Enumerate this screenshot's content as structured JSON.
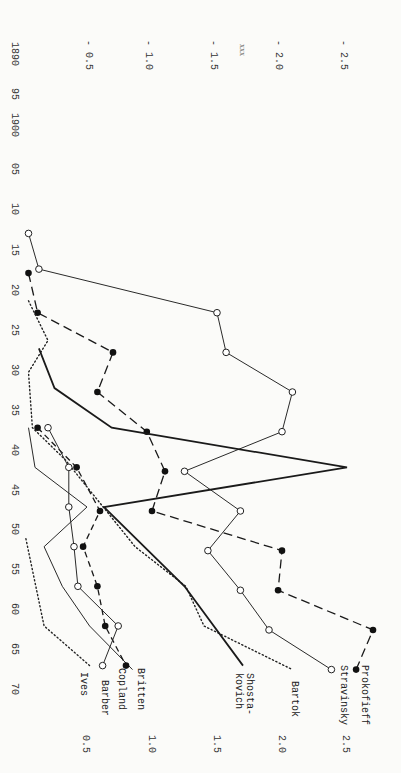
{
  "chart_data": {
    "type": "line",
    "orientation": "rotated 90 degrees clockwise (years run top-to-bottom on left edge, values run left-to-right)",
    "title": "",
    "annotation_top": "xxx",
    "xlabel": "Year",
    "ylabel": "",
    "x_ticks": [
      "1890",
      "95",
      "1900",
      "05",
      "10",
      "15",
      "20",
      "25",
      "30",
      "35",
      "40",
      "45",
      "50",
      "55",
      "60",
      "65",
      "70"
    ],
    "x_range": [
      1890,
      1970
    ],
    "y_ticks_top": [
      "-0.5",
      "-1.0",
      "-1.5",
      "-2.0",
      "-2.5"
    ],
    "y_ticks_bottom": [
      "0.5",
      "1.0",
      "1.5",
      "2.0",
      "2.5"
    ],
    "ylim": [
      0,
      2.75
    ],
    "grid": false,
    "legend": "inline labels at end of each line (bottom)",
    "series": [
      {
        "name": "Prokofieff",
        "style": "long-dash",
        "marker": "filled-circle",
        "x": [
          1917.5,
          1922.5,
          1927.5,
          1932.5,
          1937.5,
          1942.5,
          1947.5,
          1952.5,
          1957.5,
          1962.5,
          1967.5
        ],
        "values": [
          0.05,
          0.12,
          0.7,
          0.58,
          0.96,
          1.1,
          1.0,
          2.0,
          1.97,
          2.7,
          2.57
        ]
      },
      {
        "name": "Stravinsky",
        "style": "thin-solid",
        "marker": "open-circle",
        "x": [
          1912.5,
          1917,
          1922.5,
          1927.5,
          1932.5,
          1937.5,
          1942.5,
          1947.5,
          1952.5,
          1957.5,
          1962.5,
          1967.5
        ],
        "values": [
          0.05,
          0.13,
          1.5,
          1.57,
          2.08,
          2.0,
          1.25,
          1.68,
          1.43,
          1.68,
          1.9,
          2.38
        ]
      },
      {
        "name": "Bartok",
        "style": "dotted",
        "marker": "none",
        "x": [
          1921,
          1926,
          1930,
          1937,
          1941,
          1952,
          1957,
          1962,
          1967.5
        ],
        "values": [
          0.05,
          0.2,
          0.05,
          0.08,
          0.33,
          0.87,
          1.26,
          1.4,
          2.08
        ]
      },
      {
        "name": "Shosta-kovich",
        "style": "thick-solid",
        "marker": "none",
        "x": [
          1927,
          1932,
          1937,
          1942,
          1947,
          1957,
          1967
        ],
        "values": [
          0.13,
          0.25,
          0.69,
          2.5,
          0.63,
          1.25,
          1.7
        ]
      },
      {
        "name": "Britten",
        "style": "thin-solid",
        "marker": "none",
        "x": [
          1937,
          1942,
          1947,
          1952,
          1957,
          1962,
          1967.5
        ],
        "values": [
          0.05,
          0.1,
          0.5,
          0.17,
          0.31,
          0.52,
          0.85
        ]
      },
      {
        "name": "Copland",
        "style": "short-dash",
        "marker": "filled-circle",
        "x": [
          1937,
          1942,
          1947.5,
          1952,
          1957,
          1962,
          1967
        ],
        "values": [
          0.12,
          0.42,
          0.6,
          0.47,
          0.58,
          0.64,
          0.8
        ]
      },
      {
        "name": "Barber",
        "style": "thin-solid",
        "marker": "open-circle",
        "x": [
          1937,
          1942,
          1947,
          1952,
          1957,
          1962,
          1967
        ],
        "values": [
          0.2,
          0.36,
          0.36,
          0.4,
          0.43,
          0.74,
          0.62
        ]
      },
      {
        "name": "Ives",
        "style": "dotted",
        "marker": "none",
        "x": [
          1951,
          1962,
          1967
        ],
        "values": [
          0.03,
          0.17,
          0.52
        ]
      }
    ]
  },
  "labels": {
    "annotation": "xxx",
    "series_labels": {
      "prokofieff": "Prokofieff",
      "stravinsky": "Stravinsky",
      "bartok": "Bartok",
      "shosta_1": "Shosta-",
      "shosta_2": "kovich",
      "britten": "Britten",
      "copland": "Copland",
      "barber": "Barber",
      "ives": "Ives"
    },
    "top_ticks": [
      "- 0.5",
      "- 1.0",
      "- 1.5",
      "- 2.0",
      "- 2.5"
    ],
    "bottom_ticks": [
      "0.5",
      "1.0",
      "1.5",
      "2.0",
      "2.5"
    ],
    "year_ticks": [
      "1890",
      "95",
      "1900",
      "05",
      "10",
      "15",
      "20",
      "25",
      "30",
      "35",
      "40",
      "45",
      "50",
      "55",
      "60",
      "65",
      "70"
    ]
  }
}
